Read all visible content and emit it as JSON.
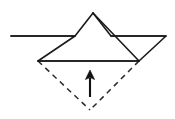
{
  "figure": {
    "canvas": {
      "width": 175,
      "height": 119,
      "background": "#ffffff"
    },
    "colors": {
      "stroke_solid": "#1a1a1a",
      "stroke_dashed": "#2a2a2a",
      "arrow": "#111111",
      "paper_fill": "#ffffff"
    },
    "stroke_widths": {
      "solid": 1.6,
      "dashed": 1.5,
      "arrow": 2.1
    },
    "dash_pattern": "5.5 4.5",
    "points": {
      "apex": {
        "x": 93,
        "y": 13
      },
      "left_tip": {
        "x": 11,
        "y": 36
      },
      "right_tip": {
        "x": 166,
        "y": 36
      },
      "left_bottom": {
        "x": 38,
        "y": 61
      },
      "right_bottom": {
        "x": 139,
        "y": 61
      },
      "left_band_junction": {
        "x": 75,
        "y": 36
      },
      "right_band_junction": {
        "x": 111,
        "y": 36
      },
      "dashed_apex": {
        "x": 90,
        "y": 110
      }
    },
    "shapes": {
      "center_triangle": "93,13 139,61 38,61",
      "left_wing": "11,36 75,36 38,61",
      "right_wing": "111,36 166,36 139,61",
      "baseline": "38,61 139,61",
      "left_upper_edge": "93,13 75,36 11,36",
      "right_upper_edge": "93,13 111,36 166,36",
      "dashed_left": "38,61 90,110",
      "dashed_right": "139,61 90,110"
    },
    "arrow": {
      "name": "fold-up-arrow",
      "direction": "up",
      "x": 90,
      "tail_y": 97,
      "tip_y": 70,
      "head_half_width": 4.6,
      "head_length": 8.5,
      "shaft": "90,97 90,78",
      "head": "90,70 94.6,79.5 90,77.6 85.4,79.5"
    }
  }
}
